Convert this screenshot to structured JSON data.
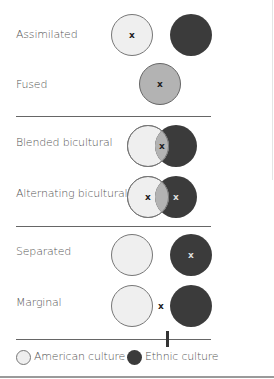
{
  "diagram": {
    "rows": [
      {
        "id": "assimilated",
        "label": "Assimilated"
      },
      {
        "id": "fused",
        "label": "Fused"
      },
      {
        "id": "blended",
        "label": "Blended bicultural"
      },
      {
        "id": "alternating",
        "label": "Alternating bicultural"
      },
      {
        "id": "separated",
        "label": "Separated"
      },
      {
        "id": "marginal",
        "label": "Marginal"
      }
    ],
    "marker": "x",
    "legend": {
      "american": "American culture",
      "ethnic": "Ethnic culture"
    },
    "colors": {
      "american_fill": "#efefef",
      "ethnic_fill": "#3b3b3b",
      "blend_fill": "#b3b3b3",
      "outline": "#777777"
    }
  }
}
